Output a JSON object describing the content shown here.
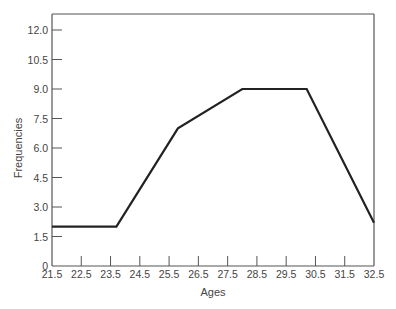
{
  "chart_data": {
    "type": "line",
    "title": "",
    "xlabel": "Ages",
    "ylabel": "Frequencies",
    "xlim": [
      21.5,
      32.5
    ],
    "ylim": [
      0,
      12.75
    ],
    "grid": false,
    "x_ticks": [
      "21.5",
      "22.5",
      "23.5",
      "24.5",
      "25.5",
      "26.5",
      "27.5",
      "28.5",
      "29.5",
      "30.5",
      "31.5",
      "32.5"
    ],
    "y_ticks": [
      "0",
      "1.5",
      "3.0",
      "4.5",
      "6.0",
      "7.5",
      "9.0",
      "10.5",
      "12.0"
    ],
    "series": [
      {
        "name": "Frequency polygon",
        "color": "#222222",
        "x": [
          21.5,
          23.7,
          25.8,
          28.0,
          30.2,
          32.5
        ],
        "y": [
          2.0,
          2.0,
          7.0,
          9.0,
          9.0,
          2.2
        ]
      }
    ]
  }
}
